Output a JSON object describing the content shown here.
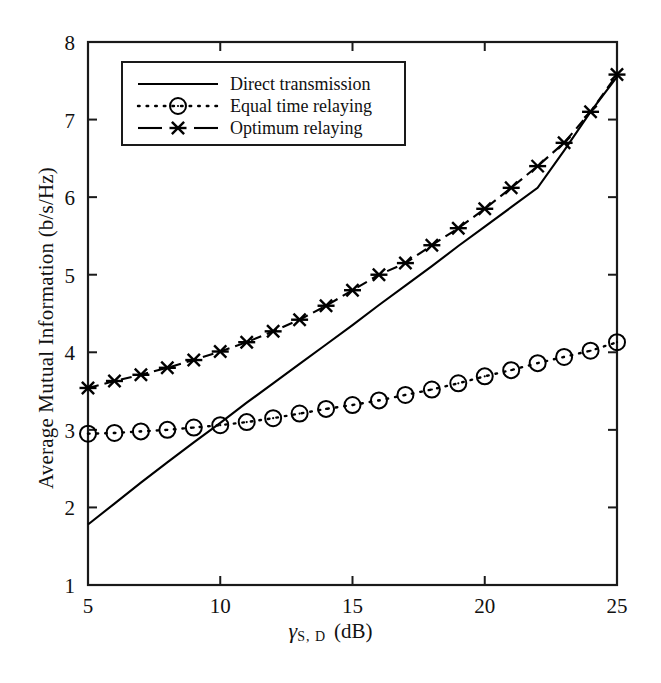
{
  "chart_data": {
    "type": "line",
    "title": "",
    "xlabel": "γS,D (dB)",
    "xlabel_symbol": "γ",
    "xlabel_subscript": "S, D",
    "xlabel_unit": "(dB)",
    "ylabel": "Average Mutual Information (b/s/Hz)",
    "xlim": [
      5,
      25
    ],
    "ylim": [
      1,
      8
    ],
    "xticks": [
      5,
      10,
      15,
      20,
      25
    ],
    "yticks": [
      1,
      2,
      3,
      4,
      5,
      6,
      7,
      8
    ],
    "xtick_labels": [
      "5",
      "10",
      "15",
      "20",
      "25"
    ],
    "ytick_labels": [
      "1",
      "2",
      "3",
      "4",
      "5",
      "6",
      "7",
      "8"
    ],
    "grid": false,
    "legend_position": "upper left",
    "x": [
      5,
      6,
      7,
      8,
      9,
      10,
      11,
      12,
      13,
      14,
      15,
      16,
      17,
      18,
      19,
      20,
      21,
      22,
      23,
      24,
      25
    ],
    "series": [
      {
        "name": "Direct transmission",
        "marker": "none",
        "linestyle": "solid",
        "color": "#000000",
        "values": [
          1.78,
          2.05,
          2.32,
          2.58,
          2.84,
          3.09,
          3.35,
          3.6,
          3.85,
          4.1,
          4.35,
          4.61,
          4.86,
          5.11,
          5.37,
          5.62,
          5.87,
          6.12,
          6.6,
          7.1,
          7.55
        ]
      },
      {
        "name": "Equal time relaying",
        "marker": "circle",
        "linestyle": "dotted",
        "color": "#000000",
        "values": [
          2.95,
          2.96,
          2.98,
          3.0,
          3.03,
          3.06,
          3.1,
          3.15,
          3.21,
          3.27,
          3.32,
          3.38,
          3.45,
          3.52,
          3.6,
          3.69,
          3.77,
          3.86,
          3.94,
          4.02,
          4.13
        ]
      },
      {
        "name": "Optimum relaying",
        "marker": "x-star",
        "linestyle": "dashed",
        "color": "#000000",
        "values": [
          3.54,
          3.63,
          3.71,
          3.8,
          3.9,
          4.01,
          4.13,
          4.27,
          4.42,
          4.6,
          4.8,
          5.0,
          5.15,
          5.38,
          5.6,
          5.85,
          6.12,
          6.4,
          6.7,
          7.1,
          7.58
        ]
      }
    ],
    "legend": [
      {
        "label": "Direct transmission",
        "sample": "solid-line"
      },
      {
        "label": "Equal time relaying",
        "sample": "dotted-line-circle-marker"
      },
      {
        "label": "Optimum relaying",
        "sample": "dashed-line-star-marker"
      }
    ]
  },
  "figure": {
    "background_color": "#ffffff",
    "axis_color": "#1a1a1a",
    "line_color": "#000000"
  }
}
